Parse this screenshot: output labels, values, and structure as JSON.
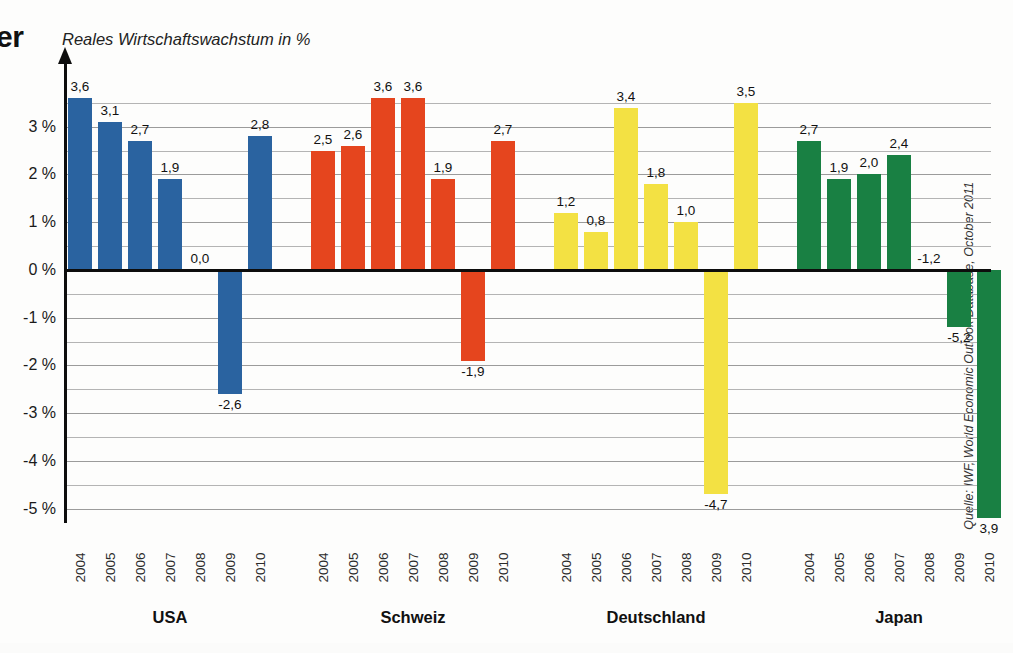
{
  "page": {
    "headline_fragment": "er",
    "source_note": "Quelle: IWF, World Economic Outlook Database, October 2011"
  },
  "chart_data": {
    "type": "bar",
    "title": "Reales Wirtschaftswachstum in %",
    "xlabel": "",
    "ylabel": "Reales Wirtschaftswachstum in %",
    "ylim": [
      -5.3,
      4.0
    ],
    "grid": true,
    "gridline_step": 0.5,
    "legend_position": "none",
    "value_decimal_separator": ",",
    "categories": [
      "2004",
      "2005",
      "2006",
      "2007",
      "2008",
      "2009",
      "2010"
    ],
    "groups": [
      {
        "name": "USA",
        "color": "#2a63a0",
        "values": [
          3.6,
          3.1,
          2.7,
          1.9,
          0.0,
          -2.6,
          2.8
        ],
        "labels": [
          "3,6",
          "3,1",
          "2,7",
          "1,9",
          "0,0",
          "-2,6",
          "2,8"
        ]
      },
      {
        "name": "Schweiz",
        "color": "#e5451e",
        "values": [
          2.5,
          2.6,
          3.6,
          3.6,
          1.9,
          -1.9,
          2.7
        ],
        "labels": [
          "2,5",
          "2,6",
          "3,6",
          "3,6",
          "1,9",
          "-1,9",
          "2,7"
        ]
      },
      {
        "name": "Deutschland",
        "color": "#f3e143",
        "values": [
          1.2,
          0.8,
          3.4,
          1.8,
          1.0,
          -4.7,
          3.5
        ],
        "labels": [
          "1,2",
          "0,8",
          "3,4",
          "1,8",
          "1,0",
          "-4,7",
          "3,5"
        ]
      },
      {
        "name": "Japan",
        "color": "#198043",
        "values": [
          2.7,
          1.9,
          2.0,
          2.4,
          0.0,
          -1.2,
          -5.2,
          3.9
        ],
        "labels": [
          "2,7",
          "1,9",
          "2,0",
          "2,4",
          "-1,2",
          "-5,2",
          "3,9"
        ]
      }
    ],
    "yticks": [
      {
        "value": 3,
        "label": "3 %"
      },
      {
        "value": 2,
        "label": "2 %"
      },
      {
        "value": 1,
        "label": "1 %"
      },
      {
        "value": 0,
        "label": "0 %"
      },
      {
        "value": -1,
        "label": "-1 %"
      },
      {
        "value": -2,
        "label": "-2 %"
      },
      {
        "value": -3,
        "label": "-3 %"
      },
      {
        "value": -4,
        "label": "-4 %"
      },
      {
        "value": -5,
        "label": "-5 %"
      }
    ]
  }
}
